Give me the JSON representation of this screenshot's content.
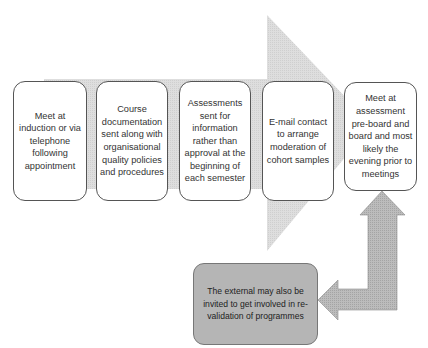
{
  "diagram": {
    "type": "process-flow",
    "main_arrow_color": "#dcdcdc",
    "side_arrow_color": "#b8b8b8",
    "steps": [
      {
        "id": 1,
        "label": "Meet at induction or via telephone following appointment"
      },
      {
        "id": 2,
        "label": "Course documentation sent along with organisational quality policies and procedures"
      },
      {
        "id": 3,
        "label": "Assessments sent for information rather than approval at the beginning of each semester"
      },
      {
        "id": 4,
        "label": "E-mail contact to arrange moderation of cohort samples"
      },
      {
        "id": 5,
        "label": "Meet at assessment pre-board and board and most likely the evening prior to meetings"
      }
    ],
    "side_note": {
      "label": "The external may also be invited to get involved in re-validation of programmes",
      "connects_from_step": 5
    }
  }
}
